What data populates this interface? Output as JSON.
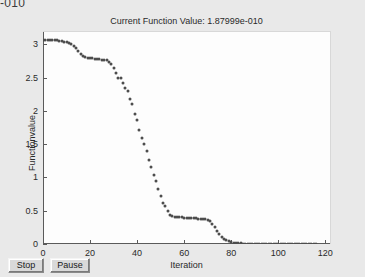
{
  "window": {
    "clipped_top_text": "-010",
    "background_color": "#e9e9e9"
  },
  "toolbar": {
    "stop_label": "Stop",
    "pause_label": "Pause"
  },
  "chart_data": {
    "type": "scatter",
    "title": "Current Function Value: 1.87999e-010",
    "xlabel": "Iteration",
    "ylabel": "Functionvalue",
    "xlim": [
      0,
      122
    ],
    "ylim": [
      0,
      3.2
    ],
    "grid": false,
    "legend": null,
    "marker_color": "#4d4d4d",
    "plot_background": "#fdfdfd",
    "xticks": [
      0,
      20,
      40,
      60,
      80,
      100,
      120
    ],
    "xtick_labels": [
      "0",
      "20",
      "40",
      "60",
      "80",
      "100",
      "120"
    ],
    "yticks": [
      0,
      0.5,
      1,
      1.5,
      2,
      2.5,
      3
    ],
    "ytick_labels": [
      "0",
      "0.5",
      "1",
      "1.5",
      "2",
      "2.5",
      "3"
    ],
    "x": [
      0,
      1,
      2,
      3,
      4,
      5,
      6,
      7,
      8,
      9,
      10,
      11,
      12,
      13,
      14,
      15,
      16,
      17,
      18,
      19,
      20,
      21,
      22,
      23,
      24,
      25,
      26,
      27,
      28,
      29,
      30,
      31,
      32,
      33,
      34,
      35,
      36,
      37,
      38,
      39,
      40,
      41,
      42,
      43,
      44,
      45,
      46,
      47,
      48,
      49,
      50,
      51,
      52,
      53,
      54,
      55,
      56,
      57,
      58,
      59,
      60,
      61,
      62,
      63,
      64,
      65,
      66,
      67,
      68,
      69,
      70,
      71,
      72,
      73,
      74,
      75,
      76,
      77,
      78,
      79,
      80,
      81,
      82,
      83,
      84,
      85,
      86,
      87,
      88,
      89,
      90,
      91,
      92,
      93,
      94,
      95,
      96,
      97,
      98,
      99,
      100,
      101,
      102,
      103,
      104,
      105,
      106,
      107,
      108,
      109,
      110,
      111,
      112,
      113,
      114,
      115,
      116
    ],
    "y": [
      3.06,
      3.06,
      3.06,
      3.06,
      3.06,
      3.06,
      3.06,
      3.05,
      3.05,
      3.04,
      3.03,
      3.02,
      3.0,
      2.97,
      2.94,
      2.9,
      2.86,
      2.83,
      2.81,
      2.8,
      2.79,
      2.79,
      2.78,
      2.78,
      2.78,
      2.77,
      2.77,
      2.76,
      2.74,
      2.7,
      2.64,
      2.57,
      2.5,
      2.49,
      2.42,
      2.35,
      2.3,
      2.18,
      2.1,
      1.96,
      1.86,
      1.72,
      1.6,
      1.5,
      1.4,
      1.26,
      1.16,
      1.04,
      0.95,
      0.82,
      0.72,
      0.62,
      0.57,
      0.5,
      0.44,
      0.42,
      0.4,
      0.4,
      0.4,
      0.4,
      0.39,
      0.39,
      0.39,
      0.39,
      0.39,
      0.39,
      0.38,
      0.38,
      0.38,
      0.37,
      0.36,
      0.34,
      0.3,
      0.25,
      0.2,
      0.15,
      0.11,
      0.08,
      0.06,
      0.045,
      0.03,
      0.022,
      0.016,
      0.012,
      0.008,
      0.006,
      0.004,
      0.003,
      0.002,
      0.0015,
      0.001,
      0.0008,
      0.0006,
      0.0004,
      0.0003,
      0.0002,
      0.00015,
      0.0001,
      8e-05,
      5e-05,
      3e-05,
      2e-05,
      1e-05,
      8e-06,
      5e-06,
      3e-06,
      2e-06,
      1e-06,
      8e-07,
      5e-07,
      3e-07,
      2e-07,
      1e-07,
      8e-08,
      5e-08,
      3e-08,
      2e-08,
      1e-08
    ]
  }
}
